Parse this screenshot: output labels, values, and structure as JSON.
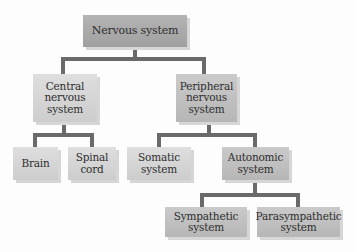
{
  "diagram": {
    "type": "hierarchy-tree",
    "root": {
      "id": "nervous_system",
      "label": "Nervous system",
      "children": [
        "central_nervous_system",
        "peripheral_nervous_system"
      ]
    },
    "nodes": {
      "nervous_system": {
        "lines": [
          "Nervous system"
        ]
      },
      "central_nervous_system": {
        "lines": [
          "Central",
          "nervous",
          "system"
        ],
        "children": [
          "brain",
          "spinal_cord"
        ]
      },
      "peripheral_nervous_system": {
        "lines": [
          "Peripheral",
          "nervous",
          "system"
        ],
        "children": [
          "somatic_system",
          "autonomic_system"
        ]
      },
      "brain": {
        "lines": [
          "Brain"
        ]
      },
      "spinal_cord": {
        "lines": [
          "Spinal",
          "cord"
        ]
      },
      "somatic_system": {
        "lines": [
          "Somatic",
          "system"
        ]
      },
      "autonomic_system": {
        "lines": [
          "Autonomic",
          "system"
        ],
        "children": [
          "sympathetic_system",
          "parasympathetic_system"
        ]
      },
      "sympathetic_system": {
        "lines": [
          "Sympathetic",
          "system"
        ]
      },
      "parasympathetic_system": {
        "lines": [
          "Parasympathetic",
          "system"
        ]
      }
    },
    "edges": [
      [
        "nervous_system",
        "central_nervous_system"
      ],
      [
        "nervous_system",
        "peripheral_nervous_system"
      ],
      [
        "central_nervous_system",
        "brain"
      ],
      [
        "central_nervous_system",
        "spinal_cord"
      ],
      [
        "peripheral_nervous_system",
        "somatic_system"
      ],
      [
        "peripheral_nervous_system",
        "autonomic_system"
      ],
      [
        "autonomic_system",
        "sympathetic_system"
      ],
      [
        "autonomic_system",
        "parasympathetic_system"
      ]
    ],
    "colors": {
      "connector": "#6a6a6a",
      "box_dark": "#a8a8a8",
      "box_mid": "#c0c0c0",
      "box_light": "#d6d6d6",
      "text": "#2e2e2e",
      "shadow": "#d6d6d6"
    }
  }
}
